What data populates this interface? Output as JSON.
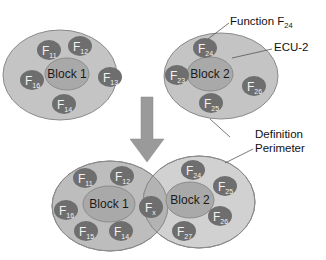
{
  "colors": {
    "outer_fill": "#c4c4c4",
    "outer_stroke": "#8a8a8a",
    "overlap_fill": "#b0b0b0",
    "inner_fill": "#a9a9a9",
    "inner_stroke": "#8c8c8c",
    "function_fill": "#6e6e6e",
    "arrow_fill": "#9a9a9a",
    "leader_line": "#555555"
  },
  "top_left": {
    "block_label": "Block 1",
    "functions": [
      {
        "base": "F",
        "sub": "11"
      },
      {
        "base": "F",
        "sub": "12"
      },
      {
        "base": "F",
        "sub": "13"
      },
      {
        "base": "F",
        "sub": "14"
      },
      {
        "base": "F",
        "sub": "16"
      }
    ]
  },
  "top_right": {
    "block_label": "Block 2",
    "functions": [
      {
        "base": "F",
        "sub": "24"
      },
      {
        "base": "F",
        "sub": "23"
      },
      {
        "base": "F",
        "sub": "26"
      },
      {
        "base": "F",
        "sub": "25"
      }
    ]
  },
  "bottom_left": {
    "block_label": "Block 1",
    "functions": [
      {
        "base": "F",
        "sub": "11"
      },
      {
        "base": "F",
        "sub": "12"
      },
      {
        "base": "F",
        "sub": "16"
      },
      {
        "base": "F",
        "sub": "15"
      },
      {
        "base": "F",
        "sub": "14"
      }
    ]
  },
  "shared_function": {
    "base": "F",
    "sub": "x"
  },
  "bottom_right": {
    "block_label": "Block 2",
    "functions": [
      {
        "base": "F",
        "sub": "24"
      },
      {
        "base": "F",
        "sub": "25"
      },
      {
        "base": "F",
        "sub": "26"
      },
      {
        "base": "F",
        "sub": "27"
      }
    ]
  },
  "annotations": {
    "function_label": "Function F",
    "function_label_sub": "24",
    "ecu_label": "ECU-2",
    "perimeter_line1": "Definition",
    "perimeter_line2": "Perimeter"
  }
}
